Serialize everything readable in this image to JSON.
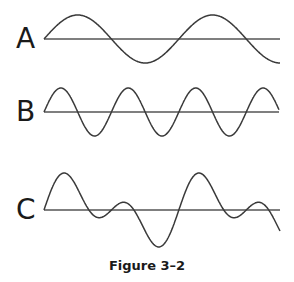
{
  "figure": {
    "caption": "Figure 3–2",
    "colors": {
      "wave": "#3a3a3a",
      "axis": "#555555",
      "text": "#1a1a1a",
      "background": "#ffffff"
    },
    "panels": [
      {
        "label": "A",
        "description": "Low-frequency sine wave, ~1.75 cycles",
        "cycles": 1.75,
        "amplitude": "large",
        "shape": "sine"
      },
      {
        "label": "B",
        "description": "Higher-frequency sine wave, ~3.5 cycles",
        "cycles": 3.5,
        "amplitude": "large",
        "shape": "sine"
      },
      {
        "label": "C",
        "description": "Complex (composite) waveform: sum of sine waves A and B",
        "cycles": 1.75,
        "amplitude": "varying",
        "shape": "complex"
      }
    ]
  }
}
